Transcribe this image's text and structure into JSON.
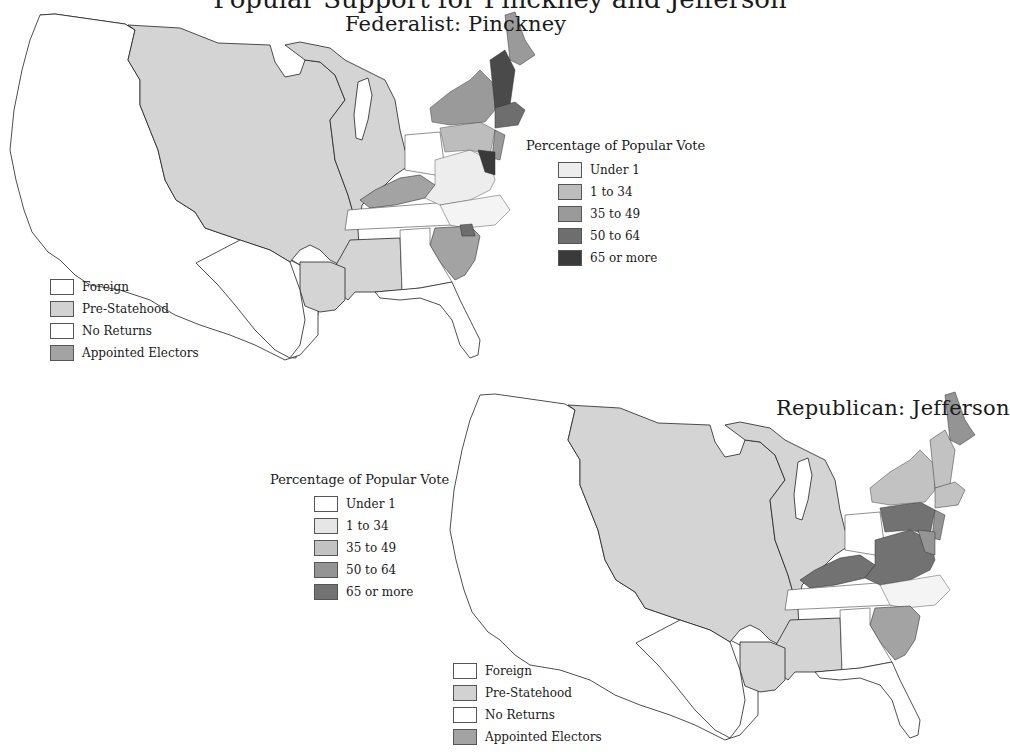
{
  "page": {
    "title_cutoff": "Popular Support for Pinckney and Jefferson"
  },
  "maps": [
    {
      "id": "federalist",
      "title": "Federalist: Pinckney",
      "vote_legend": {
        "heading": "Percentage of Popular Vote",
        "items": [
          {
            "label": "Under 1",
            "color": "#ededed"
          },
          {
            "label": "1 to 34",
            "color": "#bdbdbd"
          },
          {
            "label": "35 to 49",
            "color": "#9a9a9a"
          },
          {
            "label": "50 to 64",
            "color": "#6e6e6e"
          },
          {
            "label": "65 or more",
            "color": "#3a3a3a"
          }
        ]
      },
      "status_legend": {
        "items": [
          {
            "label": "Foreign",
            "color": "#ffffff"
          },
          {
            "label": "Pre-Statehood",
            "color": "#d2d2d2"
          },
          {
            "label": "No Returns",
            "color": "#ffffff"
          },
          {
            "label": "Appointed Electors",
            "color": "#a3a3a3"
          }
        ]
      }
    },
    {
      "id": "republican",
      "title": "Republican: Jefferson",
      "vote_legend": {
        "heading": "Percentage of Popular Vote",
        "items": [
          {
            "label": "Under 1",
            "color": "#ffffff"
          },
          {
            "label": "1 to 34",
            "color": "#e6e6e6"
          },
          {
            "label": "35 to 49",
            "color": "#c2c2c2"
          },
          {
            "label": "50 to 64",
            "color": "#949494"
          },
          {
            "label": "65 or more",
            "color": "#727272"
          }
        ]
      },
      "status_legend": {
        "items": [
          {
            "label": "Foreign",
            "color": "#ffffff"
          },
          {
            "label": "Pre-Statehood",
            "color": "#d2d2d2"
          },
          {
            "label": "No Returns",
            "color": "#ffffff"
          },
          {
            "label": "Appointed Electors",
            "color": "#a3a3a3"
          }
        ]
      }
    }
  ]
}
